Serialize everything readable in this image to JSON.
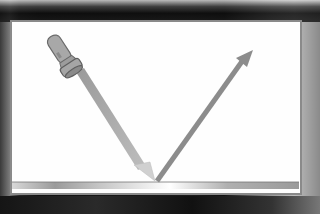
{
  "diagram": {
    "elements": {
      "light_source": "flashlight",
      "incident_ray": "arrow-toward-mirror",
      "reflected_ray": "arrow-away-from-mirror",
      "surface": "mirror"
    },
    "colors": {
      "board": "#fefefe",
      "frame": "#1a1a1a",
      "ray": "#8c8c8c",
      "incident_tip": "#c8c8c8",
      "mirror": "#b5b5b5"
    }
  }
}
